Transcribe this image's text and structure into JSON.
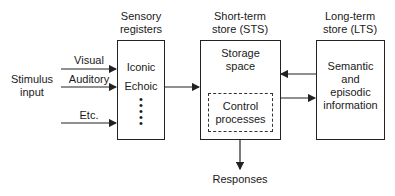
{
  "diagram": {
    "stimulus_label_line1": "Stimulus",
    "stimulus_label_line2": "input",
    "inputs": [
      {
        "label": "Visual"
      },
      {
        "label": "Auditory"
      },
      {
        "label": "Etc."
      }
    ],
    "sensory": {
      "title_line1": "Sensory",
      "title_line2": "registers",
      "items": [
        "Iconic",
        "Echoic"
      ],
      "ellipsis": "•\n•\n•\n•\n•"
    },
    "sts": {
      "title_line1": "Short-term",
      "title_line2": "store (STS)",
      "storage_line1": "Storage",
      "storage_line2": "space",
      "control_line1": "Control",
      "control_line2": "processes"
    },
    "lts": {
      "title_line1": "Long-term",
      "title_line2": "store (LTS)",
      "content_lines": [
        "Semantic",
        "and",
        "episodic",
        "information"
      ]
    },
    "output_label": "Responses",
    "colors": {
      "stroke": "#222222",
      "background": "#ffffff",
      "text": "#1a1a1a"
    }
  }
}
